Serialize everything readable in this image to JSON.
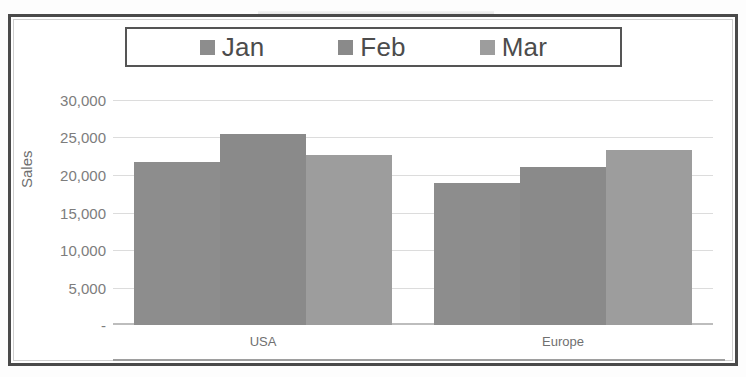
{
  "chart_data": {
    "type": "bar",
    "title": "",
    "subtitle": "",
    "xlabel": "",
    "ylabel": "Sales",
    "categories": [
      "USA",
      "Europe"
    ],
    "series": [
      {
        "name": "Jan",
        "values": [
          21700,
          19000
        ],
        "color": "#8d8d8d"
      },
      {
        "name": "Feb",
        "values": [
          25500,
          21100
        ],
        "color": "#8a8a8a"
      },
      {
        "name": "Mar",
        "values": [
          22700,
          23300
        ],
        "color": "#9d9d9d"
      }
    ],
    "ylim": [
      0,
      30000
    ],
    "y_ticks": [
      0,
      5000,
      10000,
      15000,
      20000,
      25000,
      30000
    ],
    "y_tick_labels": [
      "-",
      "5,000",
      "10,000",
      "15,000",
      "20,000",
      "25,000",
      "30,000"
    ],
    "grid": true,
    "legend_position": "top",
    "style": "grayscale-scanned-excel"
  },
  "legend": {
    "items": [
      {
        "label": "Jan",
        "color": "#8d8d8d"
      },
      {
        "label": "Feb",
        "color": "#8a8a8a"
      },
      {
        "label": "Mar",
        "color": "#9d9d9d"
      }
    ]
  },
  "axes": {
    "y_title": "Sales",
    "y_labels": [
      "30,000",
      "25,000",
      "20,000",
      "15,000",
      "10,000",
      "5,000",
      "-"
    ],
    "x_labels": [
      "USA",
      "Europe"
    ]
  },
  "colors": {
    "frame": "#4a4a4a",
    "gridline": "#dcdcdc",
    "axis_text": "#7d7d7d",
    "plot_background": "#ffffff"
  }
}
